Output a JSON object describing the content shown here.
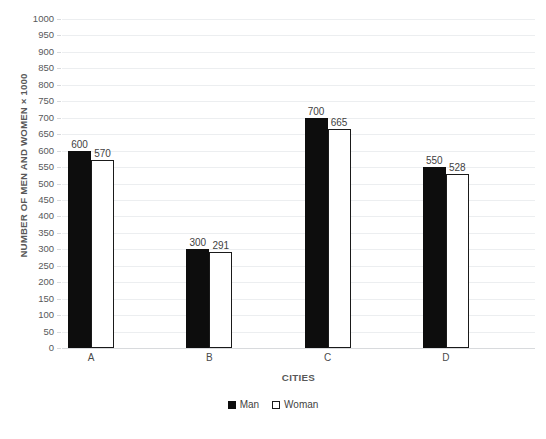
{
  "chart_data": {
    "type": "bar",
    "title": "",
    "xlabel": "CITIES",
    "ylabel": "NUMBER OF MEN AND WOMEN × 1000",
    "categories": [
      "A",
      "B",
      "C",
      "D"
    ],
    "series": [
      {
        "name": "Man",
        "color": "#0d0d0d",
        "values": [
          600,
          300,
          700,
          550
        ]
      },
      {
        "name": "Woman",
        "color": "#ffffff",
        "values": [
          570,
          291,
          665,
          528
        ]
      }
    ],
    "ylim": [
      0,
      1000
    ],
    "ytick_step": 50,
    "yticks": [
      "1000",
      "950",
      "900",
      "850",
      "800",
      "750",
      "700",
      "650",
      "600",
      "550",
      "500",
      "450",
      "400",
      "350",
      "300",
      "250",
      "200",
      "150",
      "100",
      "50",
      "0"
    ],
    "grid": true,
    "legend_position": "bottom",
    "data_labels_shown": true,
    "data_labels": {
      "Man": [
        "600",
        "300",
        "700",
        "550"
      ],
      "Woman": [
        "570",
        "291",
        "665",
        "528"
      ]
    }
  },
  "legend": {
    "items": [
      {
        "label": "Man",
        "swatch": "black-filled-square"
      },
      {
        "label": "Woman",
        "swatch": "white-outlined-square"
      }
    ]
  },
  "axes": {
    "x_title": "CITIES",
    "y_title": "NUMBER OF MEN AND WOMEN × 1000"
  },
  "clipped": {
    "title_fragment": "",
    "footer_fragment": ""
  },
  "colors": {
    "man": "#0d0d0d",
    "woman_fill": "#ffffff",
    "woman_border": "#1a1a1a",
    "gridline": "#eceef0",
    "axis_line": "#d8dadd",
    "tick_text": "#58595b",
    "axis_title_text": "#585858",
    "data_label_text": "#3f3f3f"
  }
}
